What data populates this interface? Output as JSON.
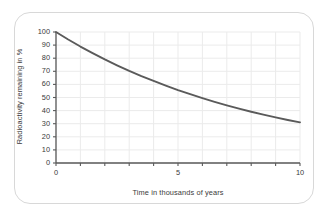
{
  "chart_data": {
    "type": "line",
    "title": "",
    "xlabel": "Time in thousands of years",
    "ylabel": "Radioactivity remaining in %",
    "xlim": [
      0,
      10
    ],
    "ylim": [
      0,
      100
    ],
    "xticks": [
      0,
      5,
      10
    ],
    "xtick_labels": [
      "0",
      "5",
      "10"
    ],
    "x_minor_tick_interval": 1,
    "yticks": [
      0,
      10,
      20,
      30,
      40,
      50,
      60,
      70,
      80,
      90,
      100
    ],
    "ytick_labels": [
      "0",
      "10",
      "20",
      "30",
      "40",
      "50",
      "60",
      "70",
      "80",
      "90",
      "100"
    ],
    "grid": true,
    "legend": "none",
    "series": [
      {
        "name": "Radioactivity remaining",
        "color": "#5a5a5a",
        "x": [
          0,
          0.5,
          1,
          1.5,
          2,
          2.5,
          3,
          3.5,
          4,
          4.5,
          5,
          5.5,
          6,
          6.5,
          7,
          7.5,
          8,
          8.5,
          9,
          9.5,
          10
        ],
        "values": [
          100,
          94.3,
          88.9,
          83.9,
          79.1,
          74.6,
          70.3,
          66.3,
          62.6,
          59.0,
          55.6,
          52.5,
          49.5,
          46.7,
          44.0,
          41.5,
          39.1,
          36.9,
          34.8,
          32.8,
          31.0
        ]
      }
    ],
    "annotations": []
  },
  "colors": {
    "curve": "#5a5a5a",
    "axis": "#5a5a5a",
    "grid": "#ebebeb",
    "text": "#3a3a3a",
    "frame": "#d8d8d8",
    "background": "#ffffff"
  }
}
